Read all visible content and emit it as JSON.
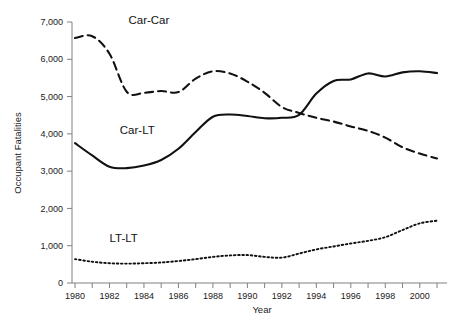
{
  "chart_data": {
    "type": "line",
    "title": "",
    "xlabel": "Year",
    "ylabel": "Occupant Fatalities",
    "xlim": [
      1980,
      2001
    ],
    "ylim": [
      0,
      7000
    ],
    "grid": false,
    "legend_position": "inline-annotations",
    "x": [
      1980,
      1981,
      1982,
      1983,
      1984,
      1985,
      1986,
      1987,
      1988,
      1989,
      1990,
      1991,
      1992,
      1993,
      1994,
      1995,
      1996,
      1997,
      1998,
      1999,
      2000,
      2001
    ],
    "xticks": [
      1980,
      1982,
      1984,
      1986,
      1988,
      1990,
      1992,
      1994,
      1996,
      1998,
      2000
    ],
    "xtick_labels": [
      "1980",
      "1982",
      "1984",
      "1986",
      "1988",
      "1990",
      "1992",
      "1994",
      "1996",
      "1998",
      "2000"
    ],
    "xminor_ticks": [
      1980,
      1981,
      1982,
      1983,
      1984,
      1985,
      1986,
      1987,
      1988,
      1989,
      1990,
      1991,
      1992,
      1993,
      1994,
      1995,
      1996,
      1997,
      1998,
      1999,
      2000,
      2001
    ],
    "yticks": [
      0,
      1000,
      2000,
      3000,
      4000,
      5000,
      6000,
      7000
    ],
    "ytick_labels": [
      "0",
      "1,000",
      "2,000",
      "3,000",
      "4,000",
      "5,000",
      "6,000",
      "7,000"
    ],
    "series": [
      {
        "name": "Car-Car",
        "style": "dashed",
        "color": "#111111",
        "label_x": 1983.1,
        "label_y": 6950,
        "values": [
          6570,
          6620,
          6150,
          5130,
          5100,
          5150,
          5120,
          5480,
          5680,
          5620,
          5400,
          5100,
          4720,
          4560,
          4430,
          4330,
          4200,
          4080,
          3900,
          3640,
          3470,
          3340
        ]
      },
      {
        "name": "Car-LT",
        "style": "solid",
        "color": "#111111",
        "label_x": 1982.6,
        "label_y": 4000,
        "values": [
          3750,
          3420,
          3120,
          3080,
          3150,
          3300,
          3600,
          4050,
          4460,
          4520,
          4480,
          4420,
          4430,
          4510,
          5080,
          5420,
          5460,
          5620,
          5540,
          5650,
          5680,
          5630
        ]
      },
      {
        "name": "LT-LT",
        "style": "dotted",
        "color": "#111111",
        "label_x": 1982.0,
        "label_y": 1100,
        "values": [
          640,
          570,
          530,
          520,
          530,
          550,
          590,
          640,
          700,
          740,
          750,
          700,
          680,
          790,
          900,
          980,
          1060,
          1130,
          1230,
          1420,
          1600,
          1670
        ]
      }
    ]
  },
  "axes": {
    "y_title": "Occupant Fatalities",
    "x_title": "Year"
  }
}
